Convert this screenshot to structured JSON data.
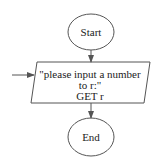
{
  "diagram": {
    "type": "flowchart",
    "colors": {
      "stroke": "#555555",
      "text": "#222222",
      "background": "#ffffff"
    },
    "nodes": [
      {
        "id": "start",
        "shape": "terminator-oval",
        "label": "Start"
      },
      {
        "id": "io",
        "shape": "parallelogram",
        "lines": [
          "\"please input a number",
          "to r:\"",
          "GET r"
        ]
      },
      {
        "id": "end",
        "shape": "terminator-oval",
        "label": "End"
      }
    ],
    "edges": [
      {
        "from": "start",
        "to": "io"
      },
      {
        "from": "external-left",
        "to": "io"
      },
      {
        "from": "io",
        "to": "end"
      }
    ]
  }
}
